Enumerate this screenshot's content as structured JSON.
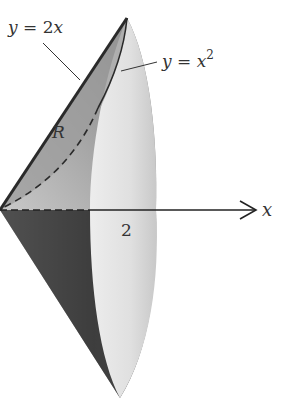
{
  "figure": {
    "type": "solid-of-revolution",
    "labels": {
      "upper_curve": "y = 2x",
      "lower_curve": "y = x",
      "lower_curve_exp": "2",
      "region": "R",
      "x_tick": "2",
      "x_axis": "x"
    },
    "colors": {
      "line": "#333333",
      "shade_dark": "#4a4a4a",
      "shade_mid": "#8a8a8a",
      "shade_light": "#e4e4e4",
      "background": "#ffffff"
    }
  }
}
